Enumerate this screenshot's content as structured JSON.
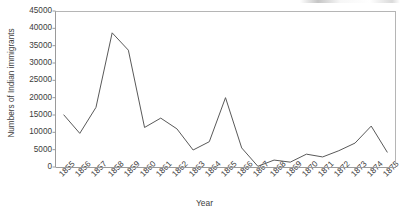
{
  "chart_data": {
    "type": "line",
    "title": "",
    "xlabel": "Year",
    "ylabel": "Numbers of Indian immigrants",
    "x": [
      1855,
      1856,
      1857,
      1858,
      1859,
      1860,
      1861,
      1862,
      1863,
      1864,
      1865,
      1866,
      1867,
      1868,
      1869,
      1870,
      1871,
      1872,
      1873,
      1874,
      1875
    ],
    "categories": [
      "1855",
      "1856",
      "1857",
      "1858",
      "1859",
      "1860",
      "1861",
      "1862",
      "1863",
      "1864",
      "1865",
      "1866",
      "1867",
      "1868",
      "1869",
      "1870",
      "1871",
      "1872",
      "1873",
      "1874",
      "1875"
    ],
    "values": [
      15100,
      9700,
      17200,
      38700,
      33700,
      11400,
      14100,
      11000,
      4900,
      7300,
      20000,
      5500,
      200,
      2000,
      1400,
      3700,
      2900,
      4700,
      6900,
      11800,
      4200
    ],
    "series": [
      {
        "name": "Numbers of Indian immigrants",
        "values": [
          15100,
          9700,
          17200,
          38700,
          33700,
          11400,
          14100,
          11000,
          4900,
          7300,
          20000,
          5500,
          200,
          2000,
          1400,
          3700,
          2900,
          4700,
          6900,
          11800,
          4200
        ]
      }
    ],
    "ylim": [
      0,
      45000
    ],
    "ytick_labels": [
      "0",
      "5000",
      "10000",
      "15000",
      "20000",
      "25000",
      "30000",
      "35000",
      "40000",
      "45000"
    ],
    "ytick_values": [
      0,
      5000,
      10000,
      15000,
      20000,
      25000,
      30000,
      35000,
      40000,
      45000
    ],
    "grid": false,
    "legend": "none",
    "line_color": "#595959",
    "axis_color": "#9a9a9a",
    "text_color": "#3c3c3c",
    "background": "#ffffff"
  }
}
